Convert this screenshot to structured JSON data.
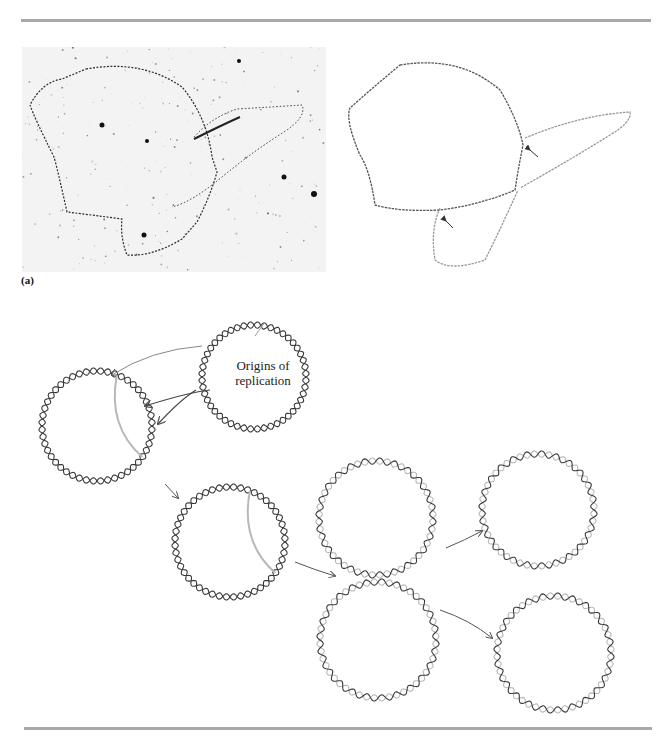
{
  "figure": {
    "panel_a_label": "(a)",
    "annotation": {
      "line1": "Origins of",
      "line2": "replication"
    },
    "colors": {
      "rule": "#a9a9a9",
      "dark_strand": "#3a3a3a",
      "light_strand": "#b8b8b8",
      "arrow": "#555555",
      "micrograph_bg": "#f3f3f3",
      "micrograph_dna": "#2a2a2a"
    },
    "micrograph": {
      "description": "electron micrograph of replicating circular DNA (theta structure)"
    },
    "tracing": {
      "description": "tracing of replicating DNA with two arrows marking replication forks",
      "arrows": 2
    },
    "replication_stages": [
      {
        "id": "parent",
        "cx": 254,
        "cy": 77,
        "r": 52,
        "light": false
      },
      {
        "id": "initiated",
        "cx": 97,
        "cy": 126,
        "r": 55,
        "light": false,
        "bubble": true
      },
      {
        "id": "bubble-expanded",
        "cx": 230,
        "cy": 242,
        "r": 55,
        "light": false,
        "bubble": true
      },
      {
        "id": "nearly-complete-top",
        "cx": 376,
        "cy": 218,
        "r": 57,
        "light": true
      },
      {
        "id": "nearly-complete-bottom",
        "cx": 378,
        "cy": 340,
        "r": 58,
        "light": true
      },
      {
        "id": "daughter-1",
        "cx": 538,
        "cy": 210,
        "r": 56,
        "light": true
      },
      {
        "id": "daughter-2",
        "cx": 554,
        "cy": 353,
        "r": 57,
        "light": true
      }
    ]
  }
}
